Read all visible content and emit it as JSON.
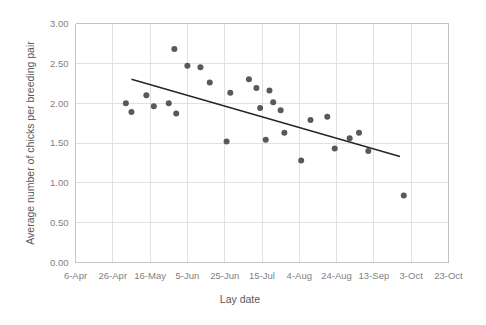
{
  "chart_data": {
    "type": "scatter",
    "title": "",
    "xlabel": "Lay date",
    "ylabel": "Average number of chicks per breeding pair",
    "grid": true,
    "legend": "none",
    "ylim": [
      0.0,
      3.0
    ],
    "yticks": [
      "0.00",
      "0.50",
      "1.00",
      "1.50",
      "2.00",
      "2.50",
      "3.00"
    ],
    "ytick_values": [
      0.0,
      0.5,
      1.0,
      1.5,
      2.0,
      2.5,
      3.0
    ],
    "xticks": [
      "6-Apr",
      "26-Apr",
      "16-May",
      "5-Jun",
      "25-Jun",
      "15-Jul",
      "4-Aug",
      "24-Aug",
      "13-Sep",
      "3-Oct",
      "23-Oct"
    ],
    "xtick_day_offsets": [
      0,
      20,
      40,
      60,
      80,
      100,
      120,
      140,
      160,
      180,
      200
    ],
    "xlim_days": [
      0,
      200
    ],
    "point_color": "#595959",
    "trendline_color": "#262626",
    "grid_color": "#d9d9d9",
    "series": [
      {
        "name": "Average chicks per breeding pair",
        "points": [
          {
            "x_days": 27,
            "x_label": "3-May",
            "y": 2.0
          },
          {
            "x_days": 30,
            "x_label": "6-May",
            "y": 1.89
          },
          {
            "x_days": 38,
            "x_label": "14-May",
            "y": 2.1
          },
          {
            "x_days": 42,
            "x_label": "18-May",
            "y": 1.96
          },
          {
            "x_days": 50,
            "x_label": "26-May",
            "y": 2.0
          },
          {
            "x_days": 53,
            "x_label": "29-May",
            "y": 2.68
          },
          {
            "x_days": 54,
            "x_label": "30-May",
            "y": 1.87
          },
          {
            "x_days": 60,
            "x_label": "5-Jun",
            "y": 2.47
          },
          {
            "x_days": 67,
            "x_label": "12-Jun",
            "y": 2.45
          },
          {
            "x_days": 72,
            "x_label": "17-Jun",
            "y": 2.26
          },
          {
            "x_days": 81,
            "x_label": "26-Jun",
            "y": 1.52
          },
          {
            "x_days": 83,
            "x_label": "28-Jun",
            "y": 2.13
          },
          {
            "x_days": 93,
            "x_label": "8-Jul",
            "y": 2.3
          },
          {
            "x_days": 97,
            "x_label": "12-Jul",
            "y": 2.19
          },
          {
            "x_days": 99,
            "x_label": "14-Jul",
            "y": 1.94
          },
          {
            "x_days": 102,
            "x_label": "17-Jul",
            "y": 1.54
          },
          {
            "x_days": 104,
            "x_label": "19-Jul",
            "y": 2.16
          },
          {
            "x_days": 106,
            "x_label": "21-Jul",
            "y": 2.01
          },
          {
            "x_days": 110,
            "x_label": "25-Jul",
            "y": 1.91
          },
          {
            "x_days": 112,
            "x_label": "27-Jul",
            "y": 1.63
          },
          {
            "x_days": 121,
            "x_label": "5-Aug",
            "y": 1.28
          },
          {
            "x_days": 126,
            "x_label": "10-Aug",
            "y": 1.79
          },
          {
            "x_days": 135,
            "x_label": "19-Aug",
            "y": 1.83
          },
          {
            "x_days": 139,
            "x_label": "23-Aug",
            "y": 1.43
          },
          {
            "x_days": 147,
            "x_label": "31-Aug",
            "y": 1.56
          },
          {
            "x_days": 152,
            "x_label": "5-Sep",
            "y": 1.63
          },
          {
            "x_days": 157,
            "x_label": "10-Sep",
            "y": 1.4
          },
          {
            "x_days": 176,
            "x_label": "29-Sep",
            "y": 0.84
          }
        ]
      }
    ],
    "trendline": {
      "x_start_days": 30,
      "y_start": 2.3,
      "x_end_days": 174,
      "y_end": 1.33
    }
  }
}
